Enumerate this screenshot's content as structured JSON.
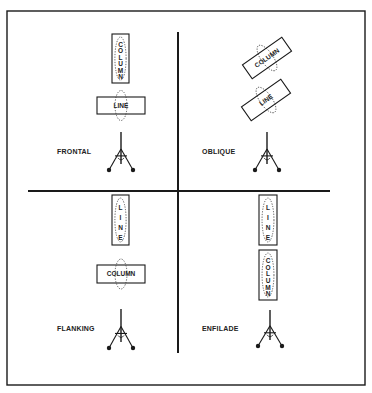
{
  "diagram": {
    "title": "",
    "frame": {
      "x": 7,
      "y": 11,
      "w": 358,
      "h": 374
    },
    "dividers": {
      "vertical": {
        "x": 178,
        "y1": 32,
        "y2": 353
      },
      "horizontal": {
        "y": 191,
        "x1": 28,
        "x2": 330
      }
    },
    "quadrants": [
      {
        "id": "frontal",
        "label": "FRONTAL",
        "label_pos": {
          "x": 57,
          "y": 154
        },
        "formations": [
          {
            "text": "COLUMN",
            "orientation": "vertical",
            "cx": 120.5,
            "cy": 58.5,
            "w": 17,
            "h": 49,
            "rotate": 0
          },
          {
            "text": "LINE",
            "orientation": "horizontal",
            "cx": 121,
            "cy": 105.5,
            "w": 48,
            "h": 17,
            "rotate": 0
          }
        ],
        "gun": {
          "x": 121,
          "top": 132,
          "feet": 170
        }
      },
      {
        "id": "oblique",
        "label": "OBLIQUE",
        "label_pos": {
          "x": 202,
          "y": 154
        },
        "formations": [
          {
            "text": "COLUMN",
            "orientation": "horizontal",
            "cx": 267,
            "cy": 58,
            "w": 48,
            "h": 17,
            "rotate": -35
          },
          {
            "text": "LINE",
            "orientation": "horizontal",
            "cx": 266,
            "cy": 100,
            "w": 48,
            "h": 17,
            "rotate": -35
          }
        ],
        "gun": {
          "x": 267,
          "top": 132,
          "feet": 170
        }
      },
      {
        "id": "flanking",
        "label": "FLANKING",
        "label_pos": {
          "x": 57,
          "y": 331
        },
        "formations": [
          {
            "text": "LINE",
            "orientation": "vertical",
            "cx": 120.5,
            "cy": 220,
            "w": 17,
            "h": 50,
            "rotate": 0
          },
          {
            "text": "COLUMN",
            "orientation": "horizontal",
            "cx": 121,
            "cy": 274,
            "w": 48,
            "h": 18,
            "rotate": 0
          }
        ],
        "gun": {
          "x": 121,
          "top": 309,
          "feet": 348
        }
      },
      {
        "id": "enfilade",
        "label": "ENFILADE",
        "label_pos": {
          "x": 202,
          "y": 331
        },
        "formations": [
          {
            "text": "LINE",
            "orientation": "vertical",
            "cx": 268,
            "cy": 220,
            "w": 18,
            "h": 50,
            "rotate": 0
          },
          {
            "text": "COLUMN",
            "orientation": "vertical",
            "cx": 268,
            "cy": 275,
            "w": 18,
            "h": 50,
            "rotate": 0
          }
        ],
        "gun": {
          "x": 270,
          "top": 310,
          "feet": 346
        }
      }
    ],
    "colors": {
      "line": "#1a1a1a",
      "background": "#ffffff"
    }
  }
}
